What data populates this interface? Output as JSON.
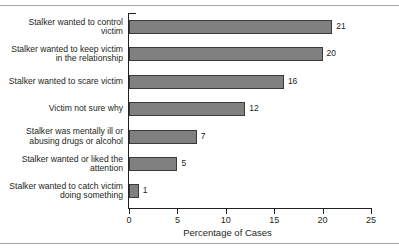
{
  "figure": {
    "name": "stalking-motivation-bar-chart",
    "top_cropped_text": "",
    "frame_color": "#a7a7a7"
  },
  "chart_data": {
    "type": "bar",
    "orientation": "horizontal",
    "title": "",
    "xlabel": "Percentage of Cases",
    "ylabel": "",
    "xlim": [
      0,
      25
    ],
    "xticks": [
      0,
      5,
      10,
      15,
      20,
      25
    ],
    "xtick_labels": [
      "0",
      "5",
      "10",
      "15",
      "20",
      "25"
    ],
    "grid": false,
    "legend": null,
    "bar_color": "#808080",
    "bar_edge_color": "#3a3a3a",
    "categories": [
      "Stalker wanted to control victim",
      "Stalker wanted to keep victim in the relationship",
      "Stalker wanted to scare victim",
      "Victim not sure why",
      "Stalker was mentally ill or abusing drugs or alcohol",
      "Stalker wanted or liked the attention",
      "Stalker wanted to catch victim doing something"
    ],
    "values": [
      21,
      20,
      16,
      12,
      7,
      5,
      1
    ],
    "value_labels": [
      "21",
      "20",
      "16",
      "12",
      "7",
      "5",
      "1"
    ]
  }
}
